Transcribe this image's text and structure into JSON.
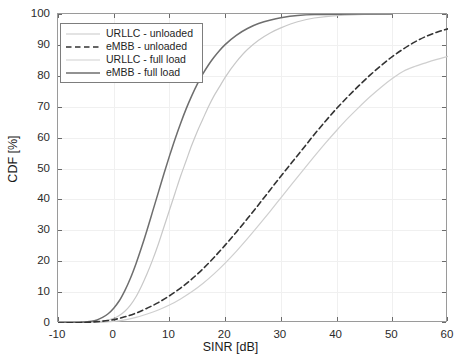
{
  "chart_data": {
    "type": "line",
    "title": "",
    "xlabel": "SINR [dB]",
    "ylabel": "CDF [%]",
    "xlim": [
      -10,
      60
    ],
    "ylim": [
      0,
      100
    ],
    "xticks": [
      -10,
      0,
      10,
      20,
      30,
      40,
      50,
      60
    ],
    "xtick_labels": [
      "-10",
      "0",
      "10",
      "20",
      "30",
      "40",
      "50",
      "60"
    ],
    "yticks": [
      0,
      10,
      20,
      30,
      40,
      50,
      60,
      70,
      80,
      90,
      100
    ],
    "ytick_labels": [
      "0",
      "10",
      "20",
      "30",
      "40",
      "50",
      "60",
      "70",
      "80",
      "90",
      "100"
    ],
    "grid": true,
    "legend_position": "upper left",
    "series": [
      {
        "name": "URLLC - unloaded",
        "color": "#c8c8c8",
        "style": "solid",
        "width": 1.2,
        "x": [
          -10,
          -6,
          -4,
          -2,
          0,
          1,
          2,
          3,
          4,
          5,
          6,
          7,
          8,
          9,
          10,
          11,
          12,
          13,
          14,
          15,
          16,
          17,
          18,
          19,
          20,
          22,
          24,
          26,
          28,
          30,
          33,
          36,
          40,
          45,
          50
        ],
        "y": [
          0,
          0,
          0.2,
          0.6,
          1.5,
          2.4,
          3.8,
          5.8,
          8.5,
          12.0,
          16.0,
          20.5,
          25.5,
          31.0,
          36.5,
          42.0,
          47.5,
          52.5,
          57.5,
          62.0,
          66.0,
          70.0,
          73.5,
          76.5,
          79.5,
          84.5,
          88.5,
          91.5,
          93.8,
          95.5,
          97.5,
          98.7,
          99.5,
          99.9,
          100
        ]
      },
      {
        "name": "eMBB - unloaded",
        "color": "#333333",
        "style": "dashed",
        "width": 1.6,
        "x": [
          -10,
          -6,
          -4,
          -2,
          0,
          2,
          4,
          6,
          8,
          10,
          12,
          14,
          16,
          18,
          20,
          22,
          24,
          26,
          28,
          30,
          32,
          34,
          36,
          38,
          40,
          42,
          44,
          46,
          48,
          50,
          52,
          54,
          56,
          58,
          60
        ],
        "y": [
          0,
          0.1,
          0.3,
          0.6,
          1.1,
          2.0,
          3.2,
          4.8,
          6.6,
          8.8,
          11.3,
          14.2,
          17.5,
          21.2,
          25.2,
          29.4,
          33.8,
          38.3,
          42.9,
          47.5,
          52.0,
          56.5,
          61.0,
          65.3,
          69.4,
          73.2,
          76.8,
          80.2,
          83.3,
          86.2,
          88.7,
          90.9,
          92.7,
          94.1,
          95.2
        ]
      },
      {
        "name": "URLLC - full load",
        "color": "#cfcfcf",
        "style": "solid",
        "width": 1.2,
        "x": [
          -10,
          -6,
          -4,
          -2,
          0,
          2,
          4,
          6,
          8,
          10,
          12,
          14,
          16,
          18,
          20,
          22,
          24,
          26,
          28,
          30,
          32,
          34,
          36,
          38,
          40,
          42,
          44,
          46,
          48,
          50,
          52,
          54,
          56,
          58,
          60
        ],
        "y": [
          0,
          0.0,
          0.1,
          0.2,
          0.5,
          1.0,
          1.8,
          2.9,
          4.2,
          5.8,
          7.8,
          10.1,
          12.8,
          15.9,
          19.4,
          23.2,
          27.3,
          31.6,
          36.0,
          40.5,
          45.0,
          49.5,
          53.9,
          58.2,
          62.3,
          66.2,
          69.8,
          73.2,
          76.3,
          79.1,
          81.5,
          83.0,
          84.2,
          85.3,
          86.3
        ]
      },
      {
        "name": "eMBB - full load",
        "color": "#6e6e6e",
        "style": "solid",
        "width": 1.5,
        "x": [
          -10,
          -6,
          -4,
          -3,
          -2,
          -1,
          0,
          1,
          2,
          3,
          4,
          5,
          6,
          7,
          8,
          9,
          10,
          11,
          12,
          13,
          14,
          15,
          16,
          17,
          18,
          19,
          20,
          22,
          24,
          26,
          28,
          30,
          33,
          36,
          40,
          44,
          48,
          50
        ],
        "y": [
          0,
          0.2,
          0.6,
          1.0,
          1.8,
          3.0,
          4.8,
          7.2,
          10.5,
          14.5,
          19.2,
          24.5,
          30.2,
          36.2,
          42.2,
          48.2,
          54.0,
          59.5,
          64.6,
          69.3,
          73.5,
          77.3,
          80.6,
          83.5,
          86.0,
          88.2,
          90.1,
          93.1,
          95.3,
          96.9,
          98.0,
          98.8,
          99.5,
          99.8,
          99.95,
          100,
          100,
          100
        ]
      }
    ]
  },
  "legend": {
    "entries": [
      {
        "label": "URLLC - unloaded"
      },
      {
        "label": "eMBB - unloaded"
      },
      {
        "label": "URLLC - full load"
      },
      {
        "label": "eMBB - full load"
      }
    ]
  },
  "axes": {
    "x_title": "SINR [dB]",
    "y_title": "CDF [%]"
  }
}
